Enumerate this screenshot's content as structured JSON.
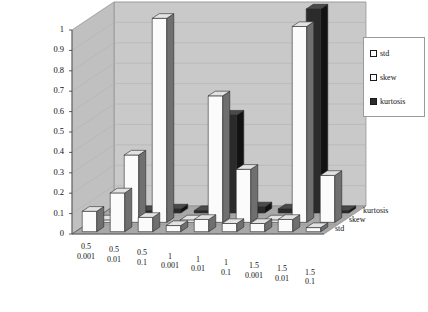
{
  "chart_data": {
    "type": "bar",
    "title": "",
    "xlabel": "",
    "ylabel": "",
    "zlabel": "",
    "ylim": [
      0,
      1
    ],
    "yticks": [
      "0",
      "0.1",
      "0.2",
      "0.3",
      "0.4",
      "0.5",
      "0.6",
      "0.7",
      "0.8",
      "0.9",
      "1"
    ],
    "grid": true,
    "legend_position": "right",
    "projection": "3d",
    "categories": [
      {
        "line1": "0.5",
        "line2": "0.001"
      },
      {
        "line1": "0.5",
        "line2": "0.01"
      },
      {
        "line1": "0.5",
        "line2": "0.1"
      },
      {
        "line1": "1",
        "line2": "0.001"
      },
      {
        "line1": "1",
        "line2": "0.01"
      },
      {
        "line1": "1",
        "line2": "0.1"
      },
      {
        "line1": "1.5",
        "line2": "0.001"
      },
      {
        "line1": "1.5",
        "line2": "0.01"
      },
      {
        "line1": "1.5",
        "line2": "0.1"
      }
    ],
    "depth_axis_labels": [
      "std",
      "skew",
      "kurtosis"
    ],
    "series": [
      {
        "name": "std",
        "color": "#ffffff",
        "values": [
          0.1,
          0.19,
          0.07,
          0.03,
          0.06,
          0.04,
          0.04,
          0.06,
          0.02
        ]
      },
      {
        "name": "skew",
        "color": "#ffffff",
        "values": [
          0.0,
          0.33,
          1.0,
          0.0,
          0.62,
          0.26,
          0.0,
          0.96,
          0.23
        ]
      },
      {
        "name": "kurtosis",
        "color": "#2b2b2b",
        "values": [
          0.0,
          0.0,
          0.02,
          0.0,
          0.48,
          0.03,
          0.02,
          1.0,
          0.01
        ]
      }
    ]
  },
  "legend": {
    "items": [
      {
        "label": "std"
      },
      {
        "label": "skew"
      },
      {
        "label": "kurtosis"
      }
    ]
  },
  "colors": {
    "back_wall": "#c9c9c9",
    "left_wall": "#c0c0c0",
    "floor": "#a8a8a8",
    "bar_light": "#fbfbfb",
    "bar_side": "#6f6f6f",
    "bar_top": "#e2e2e2",
    "bar_dark": "#2b2b2b",
    "bar_dark_side": "#121212",
    "axis_line": "#555555",
    "grid_line": "#b0b0b0"
  }
}
